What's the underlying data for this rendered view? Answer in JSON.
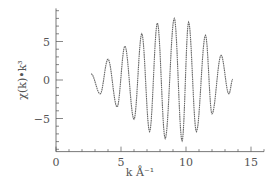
{
  "chart_data": {
    "type": "line",
    "title": "",
    "xlabel": "k Å⁻¹",
    "ylabel": "χ(k)•k³",
    "xlim": [
      0,
      16
    ],
    "ylim": [
      -9.3,
      9.3
    ],
    "x_ticks": [
      0,
      5,
      10,
      15
    ],
    "x_tick_labels": [
      "0",
      "5",
      "10",
      "15"
    ],
    "x_minor_step": 1,
    "y_ticks": [
      -5,
      0,
      5
    ],
    "y_tick_labels": [
      "−5",
      "0",
      "5"
    ],
    "y_minor_step": 1,
    "grid": false,
    "legend": "none",
    "series": [
      {
        "name": "chi(k)*k^3",
        "x": [
          2.7,
          3.4,
          4.0,
          4.7,
          5.3,
          6.0,
          6.6,
          7.2,
          7.8,
          8.4,
          9.1,
          9.7,
          10.2,
          10.8,
          11.5,
          12.0,
          12.7,
          13.3,
          13.6
        ],
        "y": [
          0.8,
          -1.8,
          2.7,
          -3.5,
          4.4,
          -5.1,
          6.0,
          -6.7,
          7.4,
          -7.6,
          8.0,
          -7.9,
          7.5,
          -6.7,
          5.8,
          -4.4,
          3.2,
          -1.8,
          0.1
        ]
      }
    ]
  }
}
